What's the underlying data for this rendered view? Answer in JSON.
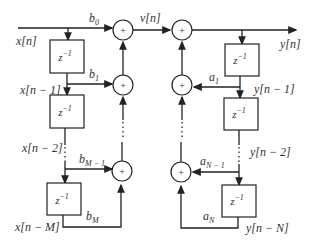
{
  "diagram": {
    "type": "Direct Form I IIR filter block diagram",
    "input": "x[n]",
    "intermediate": "v[n]",
    "output": "y[n]",
    "delay_label": "z",
    "delay_exp": "−1",
    "adder_symbol": "+",
    "feedforward": {
      "signals": [
        "x[n − 1]",
        "x[n − 2]",
        "x[n − M]"
      ],
      "coefficients": [
        "b",
        "b",
        "b",
        "b"
      ],
      "coef_subscripts": [
        "0",
        "1",
        "M − 1",
        "M"
      ]
    },
    "feedback": {
      "signals": [
        "y[n − 1]",
        "y[n − 2]",
        "y[n − N]"
      ],
      "coefficients": [
        "a",
        "a",
        "a"
      ],
      "coef_subscripts": [
        "1",
        "N − 1",
        "N"
      ]
    }
  }
}
